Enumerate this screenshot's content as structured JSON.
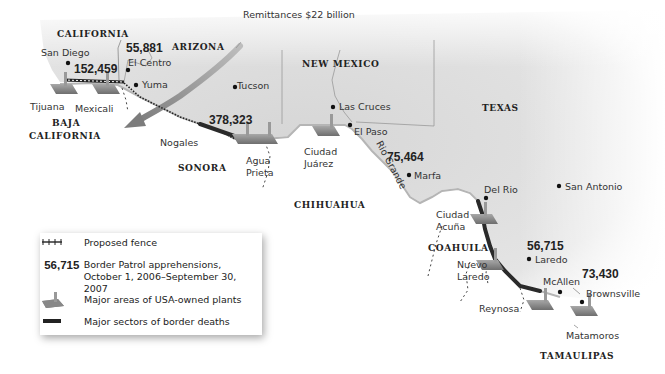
{
  "map": {
    "remittances_label": "Remittances $22 billion",
    "states_us": [
      "CALIFORNIA",
      "ARIZONA",
      "NEW MEXICO",
      "TEXAS"
    ],
    "states_mx": [
      "BAJA CALIFORNIA",
      "SONORA",
      "CHIHUAHUA",
      "COAHUILA",
      "TAMAULIPAS"
    ],
    "labels": {
      "california": "CALIFORNIA",
      "arizona": "ARIZONA",
      "new_mexico": "NEW MEXICO",
      "texas": "TEXAS",
      "baja_1": "BAJA",
      "baja_2": "CALIFORNIA",
      "sonora": "SONORA",
      "chihuahua": "CHIHUAHUA",
      "coahuila": "COAHUILA",
      "tamaulipas": "TAMAULIPAS"
    },
    "cities": {
      "san_diego": "San Diego",
      "el_centro": "El Centro",
      "yuma": "Yuma",
      "tijuana": "Tijuana",
      "mexicali": "Mexicali",
      "tucson": "Tucson",
      "nogales": "Nogales",
      "agua_1": "Agua",
      "agua_2": "Prieta",
      "las_cruces": "Las Cruces",
      "el_paso": "El Paso",
      "juarez_1": "Ciudad",
      "juarez_2": "Juárez",
      "marfa": "Marfa",
      "del_rio": "Del Rio",
      "san_antonio": "San Antonio",
      "acuna_1": "Ciudad",
      "acuna_2": "Acuña",
      "laredo": "Laredo",
      "nuevo_1": "Nuevo",
      "nuevo_2": "Laredo",
      "mcallen": "McAllen",
      "brownsville": "Brownsville",
      "reynosa": "Reynosa",
      "matamoros": "Matamoros"
    },
    "river": "Rio Grande",
    "apprehensions": {
      "san_diego": "152,459",
      "el_centro": "55,881",
      "tucson": "378,323",
      "marfa": "75,464",
      "laredo": "56,715",
      "rio_grande_valley": "73,430"
    }
  },
  "legend": {
    "items": [
      {
        "key": "fence-icon",
        "label": "Proposed fence"
      },
      {
        "key": "56,715",
        "label_1": "Border Patrol apprehensions,",
        "label_2": "October 1, 2006–September 30, 2007"
      },
      {
        "key": "plant-icon",
        "label": "Major areas of USA-owned plants"
      },
      {
        "key": "deaths-icon",
        "label": "Major sectors of border deaths"
      }
    ]
  },
  "colors": {
    "us_land": "#dcdcdc",
    "mx_land": "#ffffff",
    "arrow": "#8a8a8a",
    "border_deaths": "#2a2a2a",
    "plant": "#8e8e8e"
  }
}
